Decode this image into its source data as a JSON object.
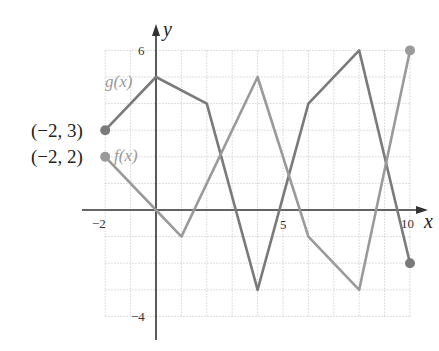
{
  "chart_data": {
    "type": "line",
    "title": "",
    "xlabel": "x",
    "ylabel": "y",
    "xlim": [
      -2,
      10
    ],
    "ylim": [
      -4,
      6
    ],
    "grid": true,
    "x_tick_labels": [
      "-2",
      "5",
      "10"
    ],
    "y_tick_labels": [
      "6",
      "-4"
    ],
    "series": [
      {
        "name": "g(x)",
        "color": "#7a7a7a",
        "x": [
          -2,
          0,
          2,
          4,
          6,
          8,
          10
        ],
        "y": [
          3,
          5,
          4,
          -3,
          4,
          6,
          -2
        ]
      },
      {
        "name": "f(x)",
        "color": "#9a9a9a",
        "x": [
          -2,
          0,
          1,
          4,
          6,
          8,
          10
        ],
        "y": [
          2,
          0,
          -1,
          5,
          -1,
          -3,
          6
        ]
      }
    ],
    "annotations": [
      {
        "text": "(−2, 3)",
        "x": -2,
        "y": 3
      },
      {
        "text": "(−2, 2)",
        "x": -2,
        "y": 2
      }
    ]
  },
  "labels": {
    "x_axis": "x",
    "y_axis": "y",
    "tick_x_neg2": "−2",
    "tick_x_5": "5",
    "tick_x_10": "10",
    "tick_y_6": "6",
    "tick_y_neg4": "−4",
    "g_label": "g(x)",
    "f_label": "f(x)",
    "point_g_start": "(−2, 3)",
    "point_f_start": "(−2, 2)"
  }
}
